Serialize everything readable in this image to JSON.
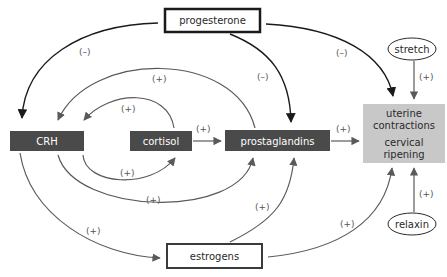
{
  "diagram": {
    "nodes": {
      "progesterone": {
        "label": "progesterone",
        "style": "thick-outline"
      },
      "crh": {
        "label": "CRH",
        "style": "dark-fill"
      },
      "cortisol": {
        "label": "cortisol",
        "style": "dark-fill"
      },
      "prostaglandins": {
        "label": "prostaglandins",
        "style": "dark-fill"
      },
      "outcome": {
        "line1": "uterine",
        "line2": "contractions",
        "line3": "cervical",
        "line4": "ripening",
        "style": "gray-fill"
      },
      "stretch": {
        "label": "stretch",
        "style": "ellipse"
      },
      "relaxin": {
        "label": "relaxin",
        "style": "ellipse"
      },
      "estrogens": {
        "label": "estrogens",
        "style": "thick-outline"
      }
    },
    "edges": [
      {
        "from": "progesterone",
        "to": "crh",
        "sign": "(–)"
      },
      {
        "from": "progesterone",
        "to": "prostaglandins",
        "sign": "(–)"
      },
      {
        "from": "progesterone",
        "to": "outcome",
        "sign": "(–)"
      },
      {
        "from": "prostaglandins",
        "to": "crh",
        "sign": "(+)"
      },
      {
        "from": "cortisol",
        "to": "crh",
        "sign": "(+)"
      },
      {
        "from": "cortisol",
        "to": "prostaglandins",
        "sign": "(+)"
      },
      {
        "from": "crh",
        "to": "cortisol",
        "sign": "(+)"
      },
      {
        "from": "crh",
        "to": "prostaglandins",
        "sign": "(+)"
      },
      {
        "from": "crh",
        "to": "estrogens",
        "sign": "(+)"
      },
      {
        "from": "estrogens",
        "to": "prostaglandins",
        "sign": "(+)"
      },
      {
        "from": "estrogens",
        "to": "outcome",
        "sign": "(+)"
      },
      {
        "from": "prostaglandins",
        "to": "outcome",
        "sign": "(+)"
      },
      {
        "from": "stretch",
        "to": "outcome",
        "sign": "(+)"
      },
      {
        "from": "relaxin",
        "to": "outcome",
        "sign": "(+)"
      }
    ],
    "colors": {
      "dark_node": "#4a4a4a",
      "gray_node": "#c8c8c8",
      "negative_arrow": "#1a1a1a",
      "positive_arrow": "#5a5a5a",
      "label": "#555555"
    }
  }
}
